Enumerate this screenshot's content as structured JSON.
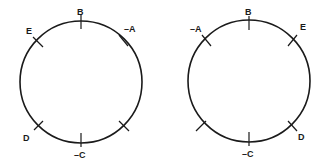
{
  "diagram": {
    "stroke_color": "#1a1a1a",
    "background": "#ffffff",
    "circles": [
      {
        "id": "left",
        "cx": 81,
        "cy": 82,
        "r": 61,
        "ticks": [
          {
            "angle": 90,
            "label": "B"
          },
          {
            "angle": 45,
            "label": "–A"
          },
          {
            "angle": 135,
            "label": "E"
          },
          {
            "angle": 225,
            "label": "D"
          },
          {
            "angle": 270,
            "label": "–C"
          },
          {
            "angle": 315,
            "label": ""
          }
        ]
      },
      {
        "id": "right",
        "cx": 249,
        "cy": 81,
        "r": 61,
        "ticks": [
          {
            "angle": 90,
            "label": "B"
          },
          {
            "angle": 135,
            "label": "–A"
          },
          {
            "angle": 45,
            "label": "E"
          },
          {
            "angle": 315,
            "label": "D"
          },
          {
            "angle": 270,
            "label": "–C"
          },
          {
            "angle": 225,
            "label": ""
          }
        ]
      }
    ]
  }
}
